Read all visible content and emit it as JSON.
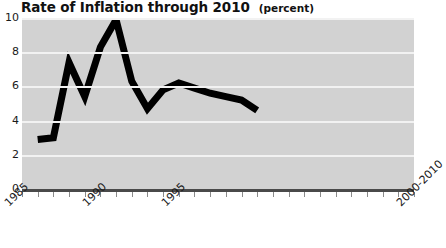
{
  "chart_data": {
    "type": "line",
    "title": "Rate of Inflation through 2010",
    "units": "(percent)",
    "subtitle": "",
    "xlabel": "",
    "ylabel": "",
    "ylim": [
      0,
      10
    ],
    "ytick_labels": [
      "10",
      "8",
      "6",
      "4",
      "2",
      "0"
    ],
    "ytick_values": [
      10,
      8,
      6,
      4,
      2,
      0
    ],
    "xtick_labels": [
      "1985",
      "1990",
      "1995",
      "2000-2010"
    ],
    "xtick_values": [
      1985,
      1990,
      1995,
      2010
    ],
    "xlim": [
      1985,
      2010
    ],
    "grid": true,
    "legend": "none",
    "line_color": "#000000",
    "plot_background": "#d2d2d2",
    "gridline_color": "#f2f2f2",
    "axis_color": "#4a4a4a",
    "x": [
      1986,
      1987,
      1988,
      1989,
      1990,
      1991,
      1992,
      1993,
      1994,
      1995,
      1996,
      1997,
      1998,
      1999,
      2000
    ],
    "values": [
      2.9,
      3.0,
      7.4,
      5.4,
      8.3,
      9.9,
      6.3,
      4.7,
      5.8,
      6.2,
      5.9,
      5.6,
      5.4,
      5.2,
      4.6
    ],
    "series": [
      {
        "name": "Rate of Inflation",
        "values": [
          2.9,
          3.0,
          7.4,
          5.4,
          8.3,
          9.9,
          6.3,
          4.7,
          5.8,
          6.2,
          5.9,
          5.6,
          5.4,
          5.2,
          4.6
        ]
      }
    ]
  }
}
